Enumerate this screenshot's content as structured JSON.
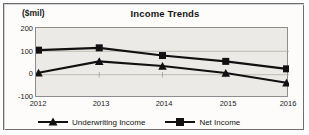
{
  "chart_data": {
    "type": "line",
    "title": "Income Trends",
    "ylabel": "($mil)",
    "xlabel": "",
    "categories": [
      "2012",
      "2013",
      "2014",
      "2015",
      "2016"
    ],
    "series": [
      {
        "name": "Underwriting Income",
        "marker": "triangle",
        "color": "#111111",
        "values": [
          8,
          57,
          37,
          7,
          -35
        ]
      },
      {
        "name": "Net Income",
        "marker": "square",
        "color": "#111111",
        "values": [
          105,
          115,
          82,
          57,
          25
        ]
      }
    ],
    "ylim": [
      -100,
      200
    ],
    "yticks": [
      200,
      100,
      0,
      -100
    ],
    "ytick_labels": [
      "200",
      "100",
      "0",
      "-100"
    ],
    "grid": true,
    "legend_position": "bottom"
  },
  "legend": {
    "items": [
      {
        "label": "Underwriting Income",
        "marker": "triangle"
      },
      {
        "label": "Net Income",
        "marker": "square"
      }
    ]
  },
  "colors": {
    "line": "#111111",
    "plot_background": "#eceae6",
    "grid": "#b4b0a8",
    "axis": "#8d8d8d",
    "text": "#141414"
  }
}
